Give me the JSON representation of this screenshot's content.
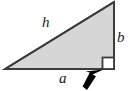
{
  "figure": {
    "type": "geometry-diagram",
    "background_color": "#ffffff",
    "labels": {
      "hypotenuse": "h",
      "base": "a",
      "vertical": "b"
    },
    "shape": {
      "name": "right-triangle",
      "fill_color": "#d6d6d6",
      "stroke_color": "#3c3c3c",
      "stroke_width": 2,
      "vertices": [
        {
          "name": "left-vertex",
          "x": 5,
          "y": 69
        },
        {
          "name": "top-right-vertex",
          "x": 114,
          "y": 2
        },
        {
          "name": "right-angle-vertex",
          "x": 114,
          "y": 69
        }
      ]
    },
    "right_angle_marker": {
      "name": "right-angle-square",
      "x": 102,
      "y": 57,
      "size": 12,
      "fill_color": "#ffffff",
      "stroke_color": "#3c3c3c"
    },
    "pointer_arrow": {
      "name": "cursor-arrow",
      "color": "#000000",
      "tip_x": 103,
      "tip_y": 69,
      "points_at": "right-angle-square"
    }
  }
}
